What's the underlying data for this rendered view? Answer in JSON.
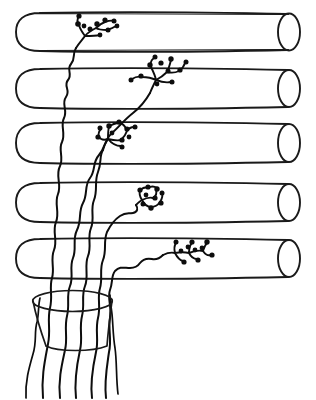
{
  "figure": {
    "title": "Schematic of afferent fibers ascending through five stacked cylindrical layers",
    "style": "hand-drawn line art",
    "background_color": "#ffffff",
    "ink_color": "#0d0d0d",
    "width": 316,
    "height": 400
  },
  "cylinders": {
    "count": 5,
    "description": "Five horizontal open-ended cylinders drawn in parallel, stacked from top to bottom; left end rounded closed, right end an open elliptical mouth",
    "left_x": 16,
    "right_x": 300,
    "cap_rx": 11,
    "items": [
      {
        "index": 1,
        "top_y": 13,
        "bottom_y": 51,
        "label": "cylinder-1"
      },
      {
        "index": 2,
        "top_y": 69,
        "bottom_y": 108,
        "label": "cylinder-2"
      },
      {
        "index": 3,
        "top_y": 123,
        "bottom_y": 163,
        "label": "cylinder-3"
      },
      {
        "index": 4,
        "top_y": 183,
        "bottom_y": 222,
        "label": "cylinder-4"
      },
      {
        "index": 5,
        "top_y": 239,
        "bottom_y": 278,
        "label": "cylinder-5"
      }
    ]
  },
  "bundle": {
    "label": "fiber-bundle",
    "description": "Tapered open cylinder (fascicle) at lower left through which all fibers pass",
    "top_ellipse": {
      "cx": 72,
      "cy": 301,
      "rx": 40,
      "ry": 10
    },
    "bottom_ellipse": {
      "cx": 78,
      "cy": 344,
      "rx": 33,
      "ry": 8
    }
  },
  "fibers": {
    "count": 7,
    "description": "Wavy afferent fibers rising from the bundle, crossing the cylinders, five of which end in a bushy terminal arborization with boutons",
    "terminals": [
      {
        "index": 1,
        "label": "terminal-arbor-1",
        "in_cylinder": 1,
        "cx": 95,
        "cy": 30,
        "boutons": 9
      },
      {
        "index": 2,
        "label": "terminal-arbor-2",
        "in_cylinder": 2,
        "cx": 157,
        "cy": 82,
        "boutons": 11
      },
      {
        "index": 3,
        "label": "terminal-arbor-3",
        "in_cylinder": 3,
        "cx": 114,
        "cy": 139,
        "boutons": 10
      },
      {
        "index": 4,
        "label": "terminal-arbor-4",
        "in_cylinder": 4,
        "cx": 148,
        "cy": 200,
        "boutons": 9
      },
      {
        "index": 5,
        "label": "terminal-arbor-5",
        "in_cylinder": 5,
        "cx": 178,
        "cy": 258,
        "boutons": 10
      }
    ],
    "descending_tails": 7
  }
}
